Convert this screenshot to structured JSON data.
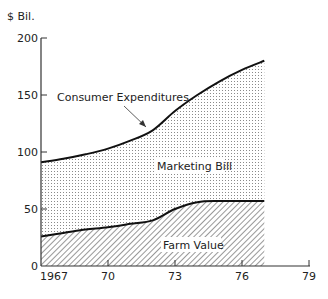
{
  "chart_data": {
    "type": "area",
    "title": "",
    "ylabel": "$ Bil.",
    "xlabel": "",
    "xlim": [
      1967,
      1979
    ],
    "ylim": [
      0,
      200
    ],
    "grid": false,
    "x_ticks": [
      1967,
      1970,
      1973,
      1976,
      1979
    ],
    "x_tick_labels": [
      "1967",
      "70",
      "73",
      "76",
      "79"
    ],
    "y_ticks": [
      0,
      50,
      100,
      150,
      200
    ],
    "y_tick_labels": [
      "0",
      "50",
      "100",
      "150",
      "200"
    ],
    "x": [
      1967,
      1968,
      1969,
      1970,
      1971,
      1972,
      1973,
      1974,
      1975,
      1976,
      1977
    ],
    "series": [
      {
        "name": "Consumer Expenditures",
        "values": [
          91,
          94,
          98,
          103,
          110,
          119,
          136,
          150,
          162,
          172,
          180
        ]
      },
      {
        "name": "Farm Value",
        "values": [
          26,
          29,
          32,
          34,
          37,
          40,
          50,
          56,
          57,
          57,
          57
        ]
      }
    ],
    "regions": [
      {
        "name": "Marketing Bill",
        "between": [
          "Farm Value",
          "Consumer Expenditures"
        ],
        "fill": "dotted"
      },
      {
        "name": "Farm Value",
        "between": [
          "axis",
          "Farm Value"
        ],
        "fill": "hatched"
      }
    ],
    "annotations": [
      {
        "text": "Consumer Expenditures",
        "arrow_to": [
          1971.8,
          119
        ]
      },
      {
        "text": "Marketing Bill"
      },
      {
        "text": "Farm Value"
      }
    ],
    "legend": "none (inline labels)"
  },
  "labels": {
    "ylabel": "$ Bil.",
    "consumer": "Consumer Expenditures",
    "marketing": "Marketing Bill",
    "farm": "Farm Value",
    "yticks": [
      "200",
      "150",
      "100",
      "50",
      "0"
    ],
    "xticks": [
      "1967",
      "70",
      "73",
      "76",
      "79"
    ]
  }
}
